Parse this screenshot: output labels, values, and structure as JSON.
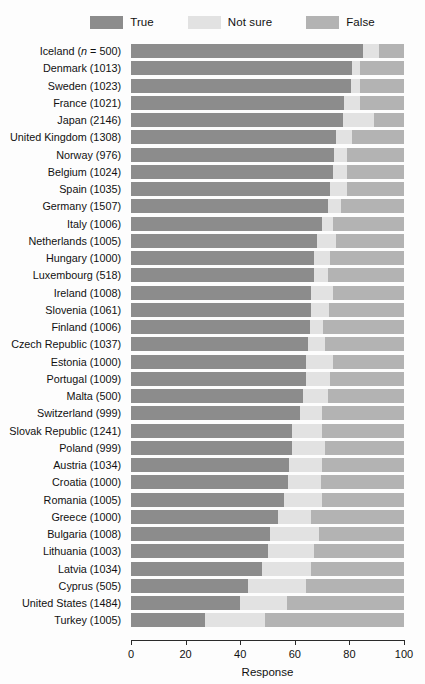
{
  "chart_data": {
    "type": "bar",
    "orientation": "horizontal",
    "stacked": true,
    "normalized": true,
    "title": "",
    "subtitle": "",
    "xlabel": "Response",
    "ylabel": "",
    "xlim": [
      0,
      100
    ],
    "xticks": [
      0,
      20,
      40,
      60,
      80,
      100
    ],
    "xticklabels": [
      "0",
      "20",
      "40",
      "60",
      "80",
      "100"
    ],
    "grid": false,
    "legend_position": "top",
    "legend": [
      {
        "label": "True",
        "color": "#8c8c8c"
      },
      {
        "label": "Not sure",
        "color": "#e2e2e2"
      },
      {
        "label": "False",
        "color": "#b3b3b3"
      }
    ],
    "series": [
      {
        "name": "True",
        "color": "#8c8c8c"
      },
      {
        "name": "Not sure",
        "color": "#e2e2e2"
      },
      {
        "name": "False",
        "color": "#b3b3b3"
      }
    ],
    "categories": [
      "Iceland (n = 500)",
      "Denmark (1013)",
      "Sweden (1023)",
      "France (1021)",
      "Japan (2146)",
      "United Kingdom (1308)",
      "Norway (976)",
      "Belgium (1024)",
      "Spain (1035)",
      "Germany (1507)",
      "Italy (1006)",
      "Netherlands (1005)",
      "Hungary (1000)",
      "Luxembourg (518)",
      "Ireland (1008)",
      "Slovenia (1061)",
      "Finland (1006)",
      "Czech Republic (1037)",
      "Estonia (1000)",
      "Portugal (1009)",
      "Malta (500)",
      "Switzerland (999)",
      "Slovak Republic (1241)",
      "Poland (999)",
      "Austria (1034)",
      "Croatia (1000)",
      "Romania (1005)",
      "Greece (1000)",
      "Bulgaria (1008)",
      "Lithuania (1003)",
      "Latvia (1034)",
      "Cyprus (505)",
      "United States (1484)",
      "Turkey (1005)"
    ],
    "rows": [
      {
        "country": "Iceland",
        "n": 500,
        "label_html": "Iceland (<i>n</i> = 500)",
        "True": 85.0,
        "Not sure": 6.0,
        "False": 9.0
      },
      {
        "country": "Denmark",
        "n": 1013,
        "label_html": "Denmark (1013)",
        "True": 81.0,
        "Not sure": 3.0,
        "False": 16.0
      },
      {
        "country": "Sweden",
        "n": 1023,
        "label_html": "Sweden (1023)",
        "True": 80.5,
        "Not sure": 3.5,
        "False": 16.0
      },
      {
        "country": "France",
        "n": 1021,
        "label_html": "France (1021)",
        "True": 78.0,
        "Not sure": 6.0,
        "False": 16.0
      },
      {
        "country": "Japan",
        "n": 2146,
        "label_html": "Japan (2146)",
        "True": 77.5,
        "Not sure": 11.5,
        "False": 11.0
      },
      {
        "country": "United Kingdom",
        "n": 1308,
        "label_html": "United Kingdom (1308)",
        "True": 75.0,
        "Not sure": 6.0,
        "False": 19.0
      },
      {
        "country": "Norway",
        "n": 976,
        "label_html": "Norway (976)",
        "True": 74.5,
        "Not sure": 4.5,
        "False": 21.0
      },
      {
        "country": "Belgium",
        "n": 1024,
        "label_html": "Belgium (1024)",
        "True": 74.0,
        "Not sure": 5.0,
        "False": 21.0
      },
      {
        "country": "Spain",
        "n": 1035,
        "label_html": "Spain (1035)",
        "True": 73.0,
        "Not sure": 6.0,
        "False": 21.0
      },
      {
        "country": "Germany",
        "n": 1507,
        "label_html": "Germany (1507)",
        "True": 72.0,
        "Not sure": 5.0,
        "False": 23.0
      },
      {
        "country": "Italy",
        "n": 1006,
        "label_html": "Italy (1006)",
        "True": 70.0,
        "Not sure": 4.0,
        "False": 26.0
      },
      {
        "country": "Netherlands",
        "n": 1005,
        "label_html": "Netherlands (1005)",
        "True": 68.0,
        "Not sure": 7.0,
        "False": 25.0
      },
      {
        "country": "Hungary",
        "n": 1000,
        "label_html": "Hungary (1000)",
        "True": 67.0,
        "Not sure": 6.0,
        "False": 27.0
      },
      {
        "country": "Luxembourg",
        "n": 518,
        "label_html": "Luxembourg (518)",
        "True": 67.0,
        "Not sure": 5.0,
        "False": 28.0
      },
      {
        "country": "Ireland",
        "n": 1008,
        "label_html": "Ireland (1008)",
        "True": 66.0,
        "Not sure": 8.0,
        "False": 26.0
      },
      {
        "country": "Slovenia",
        "n": 1061,
        "label_html": "Slovenia (1061)",
        "True": 66.0,
        "Not sure": 6.5,
        "False": 27.5
      },
      {
        "country": "Finland",
        "n": 1006,
        "label_html": "Finland (1006)",
        "True": 65.5,
        "Not sure": 5.0,
        "False": 29.5
      },
      {
        "country": "Czech Republic",
        "n": 1037,
        "label_html": "Czech Republic (1037)",
        "True": 65.0,
        "Not sure": 6.0,
        "False": 29.0
      },
      {
        "country": "Estonia",
        "n": 1000,
        "label_html": "Estonia (1000)",
        "True": 64.0,
        "Not sure": 10.0,
        "False": 26.0
      },
      {
        "country": "Portugal",
        "n": 1009,
        "label_html": "Portugal (1009)",
        "True": 64.0,
        "Not sure": 9.0,
        "False": 27.0
      },
      {
        "country": "Malta",
        "n": 500,
        "label_html": "Malta (500)",
        "True": 63.0,
        "Not sure": 9.0,
        "False": 28.0
      },
      {
        "country": "Switzerland",
        "n": 999,
        "label_html": "Switzerland (999)",
        "True": 62.0,
        "Not sure": 8.0,
        "False": 30.0
      },
      {
        "country": "Slovak Republic",
        "n": 1241,
        "label_html": "Slovak Republic (1241)",
        "True": 59.0,
        "Not sure": 11.0,
        "False": 30.0
      },
      {
        "country": "Poland",
        "n": 999,
        "label_html": "Poland (999)",
        "True": 59.0,
        "Not sure": 12.0,
        "False": 29.0
      },
      {
        "country": "Austria",
        "n": 1034,
        "label_html": "Austria (1034)",
        "True": 58.0,
        "Not sure": 12.0,
        "False": 30.0
      },
      {
        "country": "Croatia",
        "n": 1000,
        "label_html": "Croatia (1000)",
        "True": 57.5,
        "Not sure": 12.0,
        "False": 30.5
      },
      {
        "country": "Romania",
        "n": 1005,
        "label_html": "Romania (1005)",
        "True": 56.0,
        "Not sure": 14.0,
        "False": 30.0
      },
      {
        "country": "Greece",
        "n": 1000,
        "label_html": "Greece (1000)",
        "True": 54.0,
        "Not sure": 12.0,
        "False": 34.0
      },
      {
        "country": "Bulgaria",
        "n": 1008,
        "label_html": "Bulgaria (1008)",
        "True": 51.0,
        "Not sure": 18.0,
        "False": 31.0
      },
      {
        "country": "Lithuania",
        "n": 1003,
        "label_html": "Lithuania (1003)",
        "True": 50.0,
        "Not sure": 17.0,
        "False": 33.0
      },
      {
        "country": "Latvia",
        "n": 1034,
        "label_html": "Latvia (1034)",
        "True": 48.0,
        "Not sure": 18.0,
        "False": 34.0
      },
      {
        "country": "Cyprus",
        "n": 505,
        "label_html": "Cyprus (505)",
        "True": 43.0,
        "Not sure": 21.0,
        "False": 36.0
      },
      {
        "country": "United States",
        "n": 1484,
        "label_html": "United States (1484)",
        "True": 40.0,
        "Not sure": 17.0,
        "False": 43.0
      },
      {
        "country": "Turkey",
        "n": 1005,
        "label_html": "Turkey (1005)",
        "True": 27.0,
        "Not sure": 22.0,
        "False": 51.0
      }
    ]
  }
}
